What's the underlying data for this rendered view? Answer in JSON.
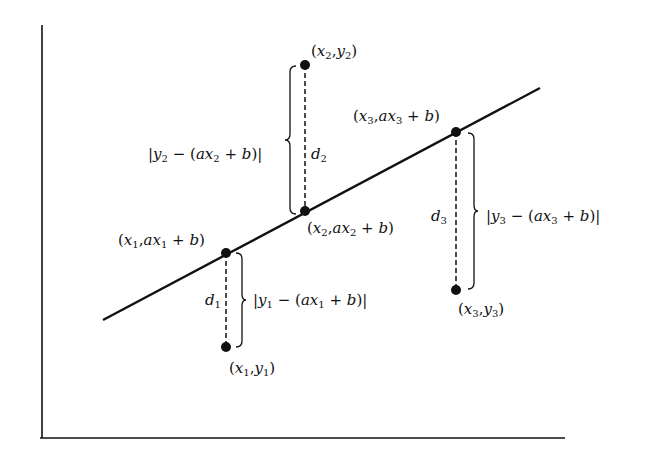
{
  "diagram": {
    "colors": {
      "ink": "#111111",
      "background": "#ffffff"
    },
    "axes": {
      "y_axis": {
        "x": 42,
        "y_top": 25,
        "y_bottom": 438
      },
      "x_axis": {
        "y": 438,
        "x_left": 40,
        "x_right": 565
      }
    },
    "line": {
      "x1": 103,
      "y1": 320,
      "x2": 540,
      "y2": 88,
      "equation": "y = ax + b"
    },
    "points": [
      {
        "id": 1,
        "data_point": {
          "x": 226,
          "y": 347,
          "label": "(x1, y1)"
        },
        "line_point": {
          "x": 226,
          "y": 253,
          "label": "(x1, ax1 + b)"
        },
        "distance_label": "d1",
        "residual_label": "|y1 − (ax1 + b)|"
      },
      {
        "id": 2,
        "data_point": {
          "x": 305,
          "y": 65,
          "label": "(x2, y2)"
        },
        "line_point": {
          "x": 305,
          "y": 211,
          "label": "(x2, ax2 + b)"
        },
        "distance_label": "d2",
        "residual_label": "|y2 − (ax2 + b)|"
      },
      {
        "id": 3,
        "data_point": {
          "x": 456,
          "y": 290,
          "label": "(x3, y3)"
        },
        "line_point": {
          "x": 456,
          "y": 132,
          "label": "(x3, ax3 + b)"
        },
        "distance_label": "d3",
        "residual_label": "|y3 − (ax3 + b)|"
      }
    ],
    "text": {
      "x1": "x",
      "y1": "y",
      "a": "a",
      "b": "b",
      "d": "d",
      "s1": "1",
      "s2": "2",
      "s3": "3",
      "open": "(",
      "close": ")",
      "comma": ",",
      "plus": " + ",
      "minus": " − ",
      "bar": "|"
    }
  }
}
